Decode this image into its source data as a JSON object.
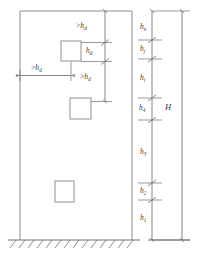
{
  "figure": {
    "colors": {
      "wall_outline": "#8c8c8c",
      "opening_outline": "#9a9a9a",
      "dimension_line": "#6f6f6f",
      "ground_hatch": "#6f6f6f",
      "text": "#3b3b3b",
      "background": "#ffffff"
    }
  },
  "spacing_dimensions": [
    {
      "id": "top-vertical-gap",
      "rel": ">",
      "symbol": "h",
      "sub": "d",
      "text": ">hd",
      "orientation": "vertical"
    },
    {
      "id": "opening-height",
      "rel": "",
      "symbol": "h",
      "sub": "d",
      "text": "hd",
      "orientation": "vertical"
    },
    {
      "id": "middle-vertical-gap",
      "rel": ">",
      "symbol": "h",
      "sub": "d",
      "text": ">hd",
      "orientation": "vertical"
    },
    {
      "id": "left-edge-distance",
      "rel": ">",
      "symbol": "h",
      "sub": "d",
      "text": ">hd",
      "orientation": "horizontal"
    }
  ],
  "storey_heights": [
    {
      "id": "h-n",
      "symbol": "h",
      "sub": "n",
      "text": "hn"
    },
    {
      "id": "h-j",
      "symbol": "h",
      "sub": "j",
      "text": "hj"
    },
    {
      "id": "h-i",
      "symbol": "h",
      "sub": "i",
      "text": "hi"
    },
    {
      "id": "h-4",
      "symbol": "h",
      "sub": "4",
      "text": "h4"
    },
    {
      "id": "h-3",
      "symbol": "h",
      "sub": "3",
      "text": "h3"
    },
    {
      "id": "h-2",
      "symbol": "h",
      "sub": "2",
      "text": "h2"
    },
    {
      "id": "h-1",
      "symbol": "h",
      "sub": "1",
      "text": "h1"
    }
  ],
  "overall_height": {
    "id": "H",
    "symbol": "H",
    "text": "H"
  },
  "openings": [
    {
      "id": "opening-upper",
      "shape": "square"
    },
    {
      "id": "opening-middle",
      "shape": "square"
    },
    {
      "id": "opening-lower",
      "shape": "square"
    }
  ],
  "ground": {
    "id": "ground-line",
    "hatch": "diagonal"
  }
}
